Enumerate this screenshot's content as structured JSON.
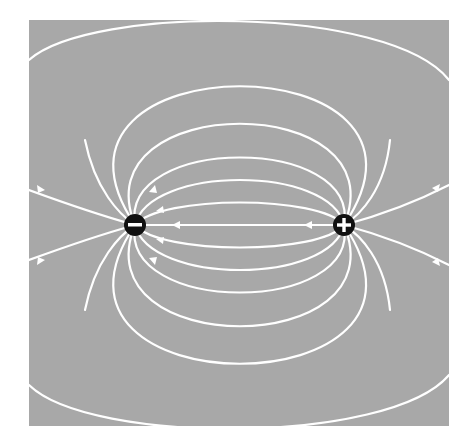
{
  "diagram": {
    "type": "electric-dipole-field",
    "background_color": "#a8a8a8",
    "line_color": "#ffffff",
    "charge_color": "#111111",
    "panel": {
      "x": 29,
      "y": 20,
      "width": 420,
      "height": 406
    },
    "charges": [
      {
        "name": "negative-charge",
        "sign": "-",
        "symbol": "−",
        "x": 135,
        "y": 225,
        "r": 11
      },
      {
        "name": "positive-charge",
        "sign": "+",
        "symbol": "+",
        "x": 344,
        "y": 225,
        "r": 11
      }
    ],
    "field_direction": "from positive to negative"
  }
}
